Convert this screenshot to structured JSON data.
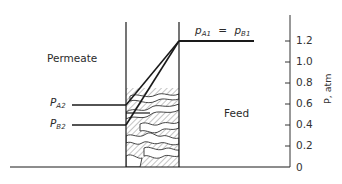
{
  "diagram": {
    "regions": {
      "permeate_label": "Permeate",
      "feed_label": "Feed"
    },
    "labels": {
      "feed_pressure": {
        "left_p": "p",
        "left_sub": "A1",
        "equals": "=",
        "right_p": "p",
        "right_sub": "B1"
      },
      "pa2": {
        "p": "P",
        "sub": "A2"
      },
      "pb2": {
        "p": "P",
        "sub": "B2"
      }
    },
    "axis": {
      "title": "P, atm",
      "ticks": [
        "1.2",
        "1.0",
        "0.8",
        "0.6",
        "0.4",
        "0.2",
        "0"
      ],
      "tick_values": [
        1.2,
        1.0,
        0.8,
        0.6,
        0.4,
        0.2,
        0
      ],
      "range": [
        0,
        1.3
      ]
    },
    "values": {
      "pA1_eq_pB1": 1.2,
      "pA2": 0.6,
      "pB2": 0.4
    },
    "colors": {
      "line": "#1a1a1a",
      "hatch": "#8a8a8a",
      "text": "#2a2a2a"
    }
  }
}
